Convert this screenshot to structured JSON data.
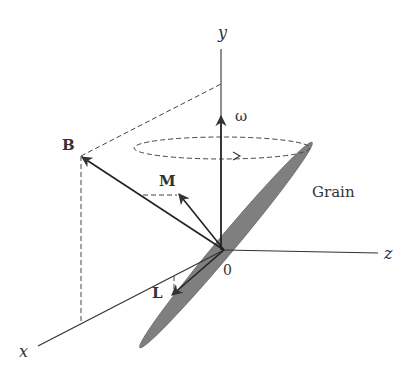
{
  "diagram": {
    "type": "3d-vector-diagram",
    "colors": {
      "line": "#333333",
      "grain_fill": "#7f7f7f",
      "background": "#ffffff"
    },
    "axes": {
      "x_label": "x",
      "y_label": "y",
      "z_label": "z",
      "origin_label": "0"
    },
    "vectors": {
      "B_label": "B",
      "M_label": "M",
      "L_label": "L",
      "omega_label": "ω"
    },
    "object": {
      "grain_label": "Grain"
    }
  }
}
